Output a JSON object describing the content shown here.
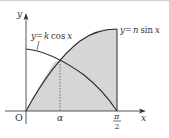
{
  "figure": {
    "curves": [
      {
        "label": "y=k cos x",
        "label_parts": {
          "lhs": "y",
          "eq": "=",
          "coef": "k",
          "fn": "cos",
          "var": "x"
        }
      },
      {
        "label": "y=n sin x",
        "label_parts": {
          "lhs": "y",
          "eq": "=",
          "coef": "n",
          "fn": "sin",
          "var": "x"
        }
      }
    ],
    "axes": {
      "x_label": "x",
      "y_label": "y",
      "origin_label": "O"
    },
    "ticks": {
      "alpha": "α",
      "pi_num": "π",
      "pi_den": "2"
    },
    "colors": {
      "shade": "#d4d4d4",
      "curve": "#2b2b2b",
      "axis": "#444444",
      "top_border": "#c8c8c8"
    }
  }
}
